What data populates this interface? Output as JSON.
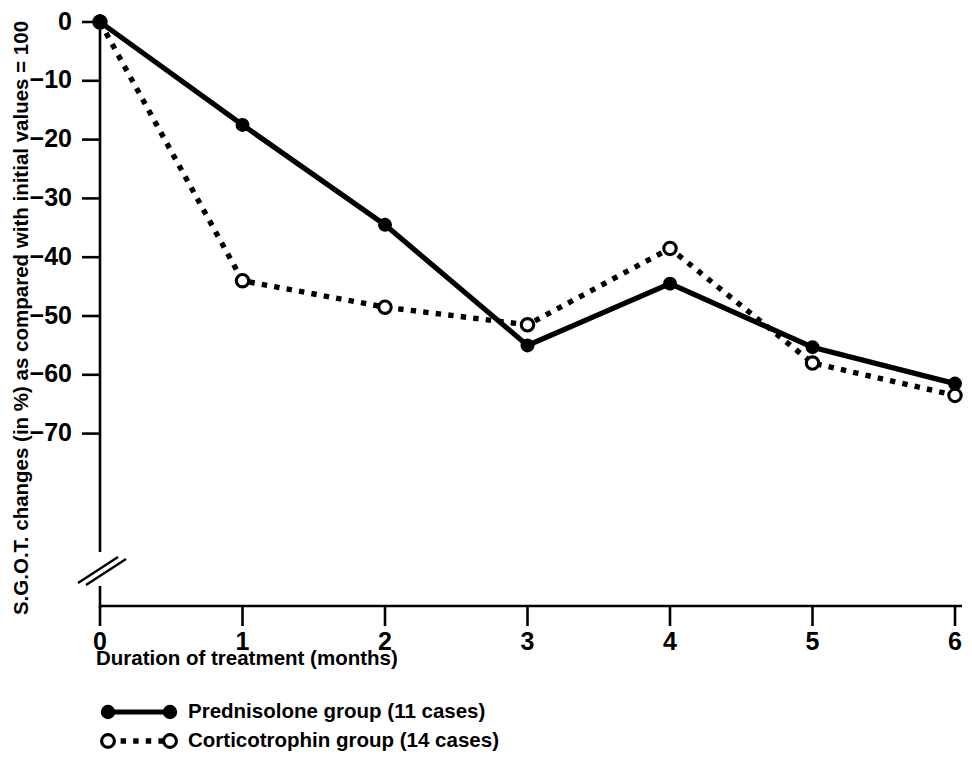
{
  "chart_data": {
    "type": "line",
    "title": "",
    "xlabel": "Duration of treatment (months)",
    "ylabel": "S.G.O.T. changes (in %) as compared with initial values = 100",
    "x": [
      0,
      1,
      2,
      3,
      4,
      5,
      6
    ],
    "xtick_labels": [
      "0",
      "1",
      "2",
      "3",
      "4",
      "5",
      "6"
    ],
    "ytick_labels": [
      "0",
      "−10",
      "−20",
      "−30",
      "−40",
      "−50",
      "−60",
      "−70"
    ],
    "ytick_values": [
      0,
      -10,
      -20,
      -30,
      -40,
      -50,
      -60,
      -70
    ],
    "xlim": [
      0,
      6
    ],
    "ylim": [
      -70,
      0
    ],
    "grid": false,
    "axis_break": true,
    "axis_break_note": "double-slash break on y-axis below −70",
    "legend_position": "below-axes-left",
    "series": [
      {
        "name": "Prednisolone group (11 cases)",
        "marker": "filled-circle",
        "line_style": "solid",
        "color": "#000000",
        "values": [
          0,
          -17.5,
          -34.5,
          -55.0,
          -44.5,
          -55.3,
          -61.5
        ]
      },
      {
        "name": "Corticotrophin group (14 cases)",
        "marker": "open-circle",
        "line_style": "dotted",
        "color": "#000000",
        "values": [
          0,
          -44.0,
          -48.5,
          -51.5,
          -38.5,
          -58.0,
          -63.5
        ]
      }
    ]
  },
  "legend": {
    "items": [
      {
        "label": "Prednisolone group (11 cases)",
        "marker": "filled-circle",
        "line_style": "solid"
      },
      {
        "label": "Corticotrophin group (14 cases)",
        "marker": "open-circle",
        "line_style": "dotted"
      }
    ]
  },
  "colors": {
    "ink": "#000000",
    "background": "#ffffff"
  }
}
